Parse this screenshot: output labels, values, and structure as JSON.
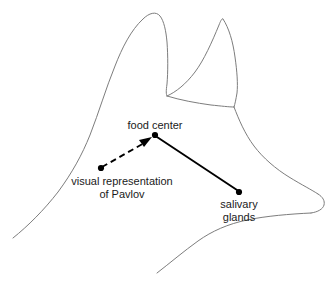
{
  "figure": {
    "kind": "diagram",
    "width": 333,
    "height": 286,
    "background_color": "#ffffff",
    "outline_color": "#7d7d7d",
    "link_color": "#000000",
    "text_color": "#1a1a1a"
  },
  "nodes": [
    {
      "id": "food-center",
      "label": "food center",
      "label_lines": [
        "food center"
      ],
      "x": 155,
      "y": 135,
      "label_x": 155,
      "label_y": 129,
      "label_anchor": "middle",
      "label_position": "above"
    },
    {
      "id": "visual-representation",
      "label": "visual representation of Pavlov",
      "label_lines": [
        "visual representation",
        "of Pavlov"
      ],
      "x": 101,
      "y": 168,
      "label_x": 122,
      "label_y": 184,
      "label_anchor": "middle",
      "label_position": "below"
    },
    {
      "id": "salivary-glands",
      "label": "salivary glands",
      "label_lines": [
        "salivary",
        "glands"
      ],
      "x": 239,
      "y": 192,
      "label_x": 239,
      "label_y": 208,
      "label_anchor": "middle",
      "label_position": "below"
    }
  ],
  "links": [
    {
      "id": "visual-to-food",
      "from": "visual-representation",
      "to": "food-center",
      "style": "dashed",
      "arrow": true,
      "arrow_at": "food-center"
    },
    {
      "id": "food-to-salivary",
      "from": "food-center",
      "to": "salivary-glands",
      "style": "solid",
      "arrow": false,
      "arrow_at": ""
    }
  ],
  "labels": {
    "food_center": "food center",
    "visual_line1": "visual representation",
    "visual_line2": "of Pavlov",
    "salivary_line1": "salivary",
    "salivary_line2": "glands"
  }
}
